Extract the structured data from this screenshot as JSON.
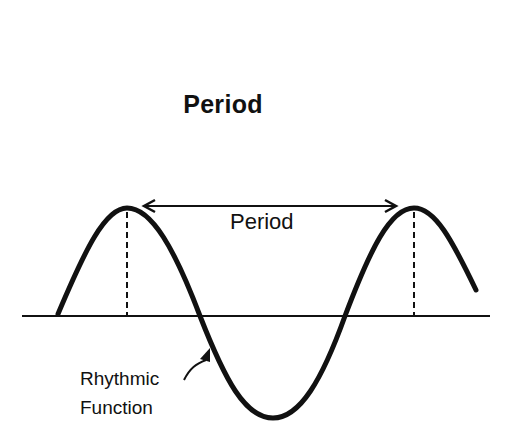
{
  "title": "Period",
  "diagram": {
    "period_label": "Period",
    "curve_label_line1": "Rhythmic",
    "curve_label_line2": "Function",
    "colors": {
      "stroke": "#111111",
      "background": "#ffffff"
    }
  }
}
